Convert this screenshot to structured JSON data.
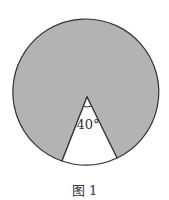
{
  "figure": {
    "angle_label": "40°",
    "caption": "图 1",
    "colors": {
      "shaded": "#b3b3b3",
      "unshaded": "#ffffff",
      "stroke": "#333333"
    },
    "circle": {
      "cx": 87,
      "cy": 93,
      "r": 73
    },
    "sector_angle_deg": 40
  }
}
